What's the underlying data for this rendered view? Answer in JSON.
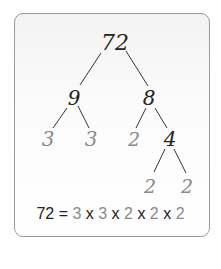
{
  "diagram": {
    "colors": {
      "composite": "#222222",
      "prime": "#8a8a8a",
      "line": "#333333",
      "border": "#9a9a9a"
    },
    "nodes": [
      {
        "id": "n72",
        "label": "72",
        "x": 115,
        "y": 43,
        "size": 22,
        "type": "composite"
      },
      {
        "id": "n9",
        "label": "9",
        "x": 74,
        "y": 98,
        "size": 20,
        "type": "composite"
      },
      {
        "id": "n8",
        "label": "8",
        "x": 149,
        "y": 98,
        "size": 20,
        "type": "composite"
      },
      {
        "id": "n3a",
        "label": "3",
        "x": 48,
        "y": 139,
        "size": 20,
        "type": "prime"
      },
      {
        "id": "n3b",
        "label": "3",
        "x": 91,
        "y": 139,
        "size": 20,
        "type": "prime"
      },
      {
        "id": "n2a",
        "label": "2",
        "x": 134,
        "y": 139,
        "size": 19,
        "type": "prime"
      },
      {
        "id": "n4",
        "label": "4",
        "x": 170,
        "y": 139,
        "size": 20,
        "type": "composite"
      },
      {
        "id": "n2b",
        "label": "2",
        "x": 150,
        "y": 186,
        "size": 19,
        "type": "prime"
      },
      {
        "id": "n2c",
        "label": "2",
        "x": 187,
        "y": 186,
        "size": 19,
        "type": "prime"
      }
    ],
    "edges": [
      {
        "x1": 101,
        "y1": 53,
        "x2": 80,
        "y2": 85
      },
      {
        "x1": 126,
        "y1": 51,
        "x2": 148,
        "y2": 86
      },
      {
        "x1": 67,
        "y1": 108,
        "x2": 53,
        "y2": 128
      },
      {
        "x1": 78,
        "y1": 106,
        "x2": 89,
        "y2": 128
      },
      {
        "x1": 146,
        "y1": 108,
        "x2": 136,
        "y2": 128
      },
      {
        "x1": 155,
        "y1": 108,
        "x2": 167,
        "y2": 128
      },
      {
        "x1": 165,
        "y1": 149,
        "x2": 154,
        "y2": 172
      },
      {
        "x1": 174,
        "y1": 149,
        "x2": 186,
        "y2": 173
      }
    ],
    "equation": {
      "lhs": "72",
      "equals": " = ",
      "factors": [
        "3",
        "3",
        "2",
        "2",
        "2"
      ],
      "operator": " x "
    }
  }
}
